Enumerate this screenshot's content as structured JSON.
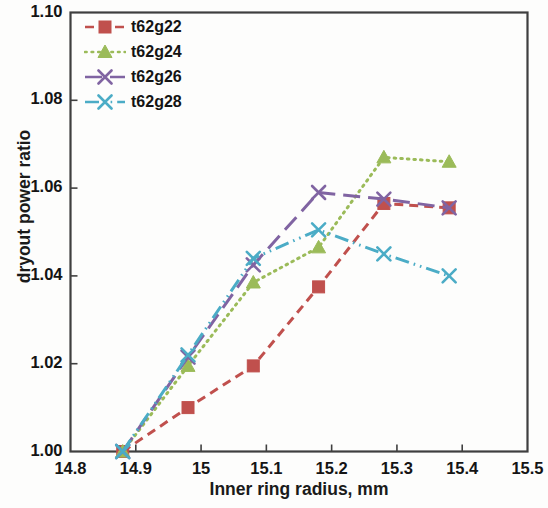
{
  "chart_data": {
    "type": "line",
    "title": "",
    "xlabel": "Inner ring radius, mm",
    "ylabel": "dryout power ratio",
    "xlim": [
      14.8,
      15.5
    ],
    "ylim": [
      1.0,
      1.1
    ],
    "xticks": [
      "14.8",
      "14.9",
      "15",
      "15.1",
      "15.2",
      "15.3",
      "15.4",
      "15.5"
    ],
    "xtick_values": [
      14.8,
      14.9,
      15.0,
      15.1,
      15.2,
      15.3,
      15.4,
      15.5
    ],
    "yticks": [
      "1.00",
      "1.02",
      "1.04",
      "1.06",
      "1.08",
      "1.10"
    ],
    "ytick_values": [
      1.0,
      1.02,
      1.04,
      1.06,
      1.08,
      1.1
    ],
    "grid": false,
    "legend_position": "top-left",
    "series": [
      {
        "name": "t62g22",
        "color": "#C0504D",
        "marker": "square",
        "dash": "dashed",
        "x": [
          14.88,
          14.98,
          15.08,
          15.18,
          15.28,
          15.38
        ],
        "y": [
          1.0,
          1.01,
          1.0195,
          1.0375,
          1.0565,
          1.0555
        ]
      },
      {
        "name": "t62g24",
        "color": "#9BBB59",
        "marker": "triangle",
        "dash": "dotted",
        "x": [
          14.88,
          14.98,
          15.08,
          15.18,
          15.28,
          15.38
        ],
        "y": [
          1.0,
          1.0195,
          1.0385,
          1.0465,
          1.067,
          1.066
        ]
      },
      {
        "name": "t62g26",
        "color": "#8064A2",
        "marker": "x",
        "dash": "long-dash",
        "x": [
          14.88,
          14.98,
          15.08,
          15.18,
          15.28,
          15.38
        ],
        "y": [
          1.0,
          1.0215,
          1.0425,
          1.059,
          1.0575,
          1.0555
        ]
      },
      {
        "name": "t62g28",
        "color": "#4BACC6",
        "marker": "x",
        "dash": "dash-dot-dot",
        "x": [
          14.88,
          14.98,
          15.08,
          15.18,
          15.28,
          15.38
        ],
        "y": [
          1.0,
          1.022,
          1.044,
          1.0505,
          1.045,
          1.04
        ]
      }
    ]
  },
  "axes": {
    "frame_color": "#3f3f3f",
    "background": "#fdfdfc"
  }
}
